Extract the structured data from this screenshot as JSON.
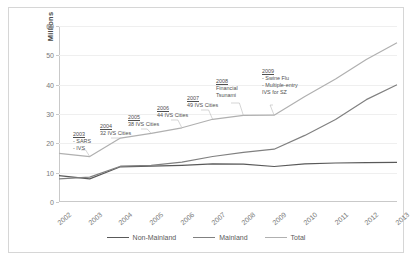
{
  "chart_data": {
    "type": "line",
    "title": "",
    "xlabel": "",
    "ylabel": "Millions",
    "ylim": [
      0,
      60
    ],
    "yticks": [
      0,
      10,
      20,
      30,
      40,
      50,
      60
    ],
    "grid": true,
    "legend_position": "bottom-center",
    "categories": [
      "2002",
      "2003",
      "2004",
      "2005",
      "2006",
      "2007",
      "2008",
      "2009",
      "2010",
      "2011",
      "2012",
      "2013"
    ],
    "series": [
      {
        "name": "Non-Mainland",
        "color": "#595959",
        "values": [
          9.0,
          7.9,
          12.0,
          12.2,
          12.5,
          13.0,
          12.9,
          12.1,
          13.0,
          13.3,
          13.4,
          13.5
        ]
      },
      {
        "name": "Mainland",
        "color": "#808080",
        "values": [
          7.9,
          8.5,
          12.2,
          12.5,
          13.6,
          15.5,
          16.9,
          18.0,
          22.7,
          28.1,
          34.9,
          40.0
        ]
      },
      {
        "name": "Total",
        "color": "#b0b0b0",
        "values": [
          16.6,
          15.5,
          21.8,
          23.4,
          25.3,
          28.2,
          29.5,
          29.6,
          36.0,
          41.9,
          48.6,
          54.3
        ]
      }
    ],
    "annotations": [
      {
        "year": "2003",
        "lines": [
          "- SARS",
          "- IVS"
        ]
      },
      {
        "year": "2004",
        "lines": [
          "32 IVS Cities"
        ]
      },
      {
        "year": "2005",
        "lines": [
          "38 IVS Cities"
        ]
      },
      {
        "year": "2006",
        "lines": [
          "44 IVS Cities"
        ]
      },
      {
        "year": "2007",
        "lines": [
          "49 IVS Cities"
        ]
      },
      {
        "year": "2008",
        "lines": [
          "Financial",
          "Tsunami"
        ]
      },
      {
        "year": "2009",
        "lines": [
          "- Swine Flu",
          "- Multiple-entry",
          "IVS for SZ"
        ]
      }
    ]
  }
}
